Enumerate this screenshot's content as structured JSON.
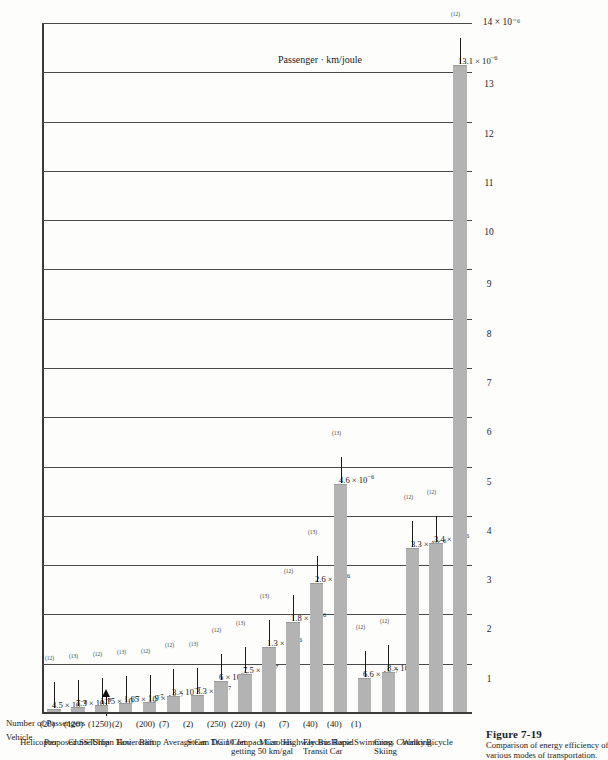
{
  "figure": {
    "number": "Figure 7-19",
    "caption_line1": "Comparison of energy efficiency of",
    "caption_line2": "various modes of transportation."
  },
  "headers": {
    "vehicle": "Vehicle",
    "passengers": "Number of Passengers"
  },
  "axis": {
    "title": "Passenger · km/joule",
    "tick_labels": [
      "1",
      "2",
      "3",
      "4",
      "5",
      "6",
      "7",
      "8",
      "9",
      "10",
      "11",
      "12",
      "13",
      "14 × 10⁻⁶"
    ],
    "max_label": "14 × 10⁻⁶"
  },
  "colors": {
    "bar_fill": "#b3b3b3",
    "axis": "#3a3a3a",
    "grid": "#4a4a4a",
    "text": "#1b1b1b",
    "page": "#fdfdfb"
  },
  "chart_data": {
    "type": "bar",
    "title": "Comparison of energy efficiency of various modes of transportation.",
    "xlabel": "Passenger · km/joule",
    "ylabel": "Vehicle",
    "orientation": "horizontal",
    "xlim": [
      0,
      1.4e-05
    ],
    "unit_scale": "1e-6",
    "grid": true,
    "legend": "none",
    "categories": [
      "Helicopter",
      "Proposed SST",
      "Cruise Ship",
      "Urban Taxi",
      "Hovercraft",
      "Blimp",
      "Average Car",
      "Steam Train",
      "DC 10 Jet",
      "Compact Car getting 50 km/gal",
      "Microbus",
      "Highway Bus",
      "Electric Rapid Transit Car",
      "Horse",
      "Swimming",
      "Cross Country Skiing",
      "Walking",
      "Bicycle"
    ],
    "values": [
      4.5e-08,
      7.3e-08,
      1.15e-07,
      1.65e-07,
      1.9e-07,
      3e-07,
      3.3e-07,
      6e-07,
      7.5e-07,
      1.3e-06,
      1.8e-06,
      2.6e-06,
      4.6e-06,
      6.6e-07,
      8e-07,
      3.3e-06,
      3.4e-06,
      1.31e-05
    ],
    "rows": [
      {
        "name": "Helicopter",
        "name2": "",
        "passengers": "(20)",
        "value": 4.5e-08,
        "value_mant": "4.5",
        "value_exp": "−8",
        "cite": "(12)"
      },
      {
        "name": "Proposed SST",
        "name2": "",
        "passengers": "(120)",
        "value": 7.3e-08,
        "value_mant": "7.3",
        "value_exp": "−8",
        "cite": "(13)"
      },
      {
        "name": "Cruise Ship",
        "name2": "",
        "passengers": "(1250)",
        "value": 1.15e-07,
        "value_mant": "1.15",
        "value_exp": "−7",
        "cite": "(12)"
      },
      {
        "name": "Urban Taxi",
        "name2": "",
        "passengers": "(2)",
        "value": 1.65e-07,
        "value_mant": "1.65",
        "value_exp": "−7",
        "cite": "(13)"
      },
      {
        "name": "Hovercraft",
        "name2": "",
        "passengers": "(200)",
        "value": 1.9e-07,
        "value_mant": "1.9",
        "value_exp": "−7",
        "cite": "(12)"
      },
      {
        "name": "Blimp",
        "name2": "",
        "passengers": "(7)",
        "value": 3e-07,
        "value_mant": "3",
        "value_exp": "−7",
        "cite": "(12)"
      },
      {
        "name": "Average Car",
        "name2": "",
        "passengers": "(2)",
        "value": 3.3e-07,
        "value_mant": "3.3",
        "value_exp": "−7",
        "cite": "(13)"
      },
      {
        "name": "Steam Train",
        "name2": "",
        "passengers": "(250)",
        "value": 6e-07,
        "value_mant": "6",
        "value_exp": "−7",
        "cite": "(12)"
      },
      {
        "name": "DC 10 Jet",
        "name2": "",
        "passengers": "(220)",
        "value": 7.5e-07,
        "value_mant": "7.5",
        "value_exp": "−7",
        "cite": "(13)"
      },
      {
        "name": "Compact Car",
        "name2": "getting 50 km/gal",
        "passengers": "(4)",
        "value": 1.3e-06,
        "value_mant": "1.3",
        "value_exp": "−6",
        "cite": "(13)"
      },
      {
        "name": "Microbus",
        "name2": "",
        "passengers": "(7)",
        "value": 1.8e-06,
        "value_mant": "1.8",
        "value_exp": "−6",
        "cite": "(12)"
      },
      {
        "name": "Highway Bus",
        "name2": "",
        "passengers": "(40)",
        "value": 2.6e-06,
        "value_mant": "2.6",
        "value_exp": "−6",
        "cite": "(13)"
      },
      {
        "name": "Electric Rapid",
        "name2": "Transit Car",
        "passengers": "(40)",
        "value": 4.6e-06,
        "value_mant": "4.6",
        "value_exp": "−6",
        "cite": "(13)"
      },
      {
        "name": "Horse",
        "name2": "",
        "passengers": "(1)",
        "value": 6.6e-07,
        "value_mant": "6.6",
        "value_exp": "−7",
        "cite": "(12)"
      },
      {
        "name": "Swimming",
        "name2": "",
        "passengers": "",
        "value": 8e-07,
        "value_mant": "8",
        "value_exp": "−7",
        "cite": "(12)"
      },
      {
        "name": "Cross Country",
        "name2": "Skiing",
        "passengers": "",
        "value": 3.3e-06,
        "value_mant": "3.3",
        "value_exp": "−6",
        "cite": "(12)"
      },
      {
        "name": "Walking",
        "name2": "",
        "passengers": "",
        "value": 3.4e-06,
        "value_mant": "3.4",
        "value_exp": "−6",
        "cite": "(12)"
      },
      {
        "name": "Bicycle",
        "name2": "",
        "passengers": "",
        "value": 1.31e-05,
        "value_mant": "13.1",
        "value_exp": "−6",
        "cite": "(12)"
      }
    ]
  }
}
